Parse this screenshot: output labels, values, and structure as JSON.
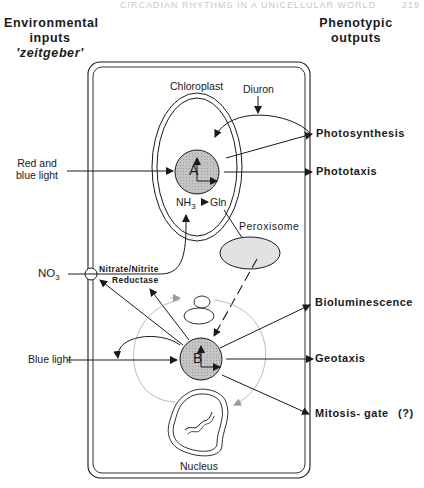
{
  "page_header": {
    "running_title": "CIRCADIAN RHYTHMS IN A UNICELLULAR WORLD",
    "page_number": "219"
  },
  "headers": {
    "inputs_line1": "Environmental",
    "inputs_line2": "inputs",
    "inputs_line3": "'zeitgeber'",
    "outputs_line1": "Phenotypic",
    "outputs_line2": "outputs"
  },
  "inputs": {
    "red_blue_line1": "Red and",
    "red_blue_line2": "blue  light",
    "no3": "NO",
    "no3_sub": "3",
    "blue_light": "Blue  light"
  },
  "organelles": {
    "chloroplast": "Chloroplast",
    "peroxisome": "Peroxisome",
    "nucleus": "Nucleus",
    "reductase_line1": "Nitrate/Nitrite",
    "reductase_line2": "Reductase",
    "diuron": "Diuron",
    "nh3": "NH",
    "nh3_sub": "3",
    "gln": "Gln",
    "oscillator_a": "A",
    "oscillator_b": "B"
  },
  "outputs": {
    "photosynthesis": "Photosynthesis",
    "phototaxis": "Phototaxis",
    "bioluminescence": "Bioluminescence",
    "geotaxis": "Geotaxis",
    "mitosis_gate": "Mitosis- gate",
    "mitosis_note": "(?)"
  },
  "colors": {
    "line": "#1a1a1a",
    "oscillator_fill": "#bdbdbd",
    "peroxisome_fill": "#e2e2e2",
    "faint_arrow": "#9a9a9a"
  }
}
